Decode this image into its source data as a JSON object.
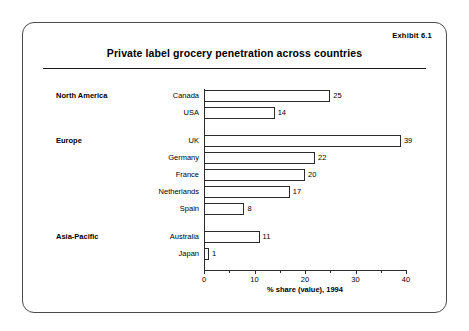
{
  "exhibit_label": "Exhibit 6.1",
  "title": "Private label grocery penetration across countries",
  "chart_data": {
    "type": "bar",
    "orientation": "horizontal",
    "title": "Private label grocery penetration across countries",
    "xlabel": "% share (value), 1994",
    "ylabel": "",
    "xlim": [
      0,
      40
    ],
    "xticks": [
      0,
      10,
      20,
      30,
      40
    ],
    "xtick_labels": [
      "0",
      "10",
      "20",
      "30",
      "40"
    ],
    "minor_tick_step": 5,
    "grid": false,
    "legend": false,
    "categories": [
      "Canada",
      "USA",
      "UK",
      "Germany",
      "France",
      "Netherlands",
      "Spain",
      "Australia",
      "Japan"
    ],
    "values": [
      25,
      14,
      39,
      22,
      20,
      17,
      8,
      11,
      1
    ],
    "groups": [
      {
        "region": "North America",
        "items": [
          {
            "country": "Canada",
            "value": 25,
            "value_label": "25"
          },
          {
            "country": "USA",
            "value": 14,
            "value_label": "14"
          }
        ]
      },
      {
        "region": "Europe",
        "items": [
          {
            "country": "UK",
            "value": 39,
            "value_label": "39"
          },
          {
            "country": "Germany",
            "value": 22,
            "value_label": "22"
          },
          {
            "country": "France",
            "value": 20,
            "value_label": "20"
          },
          {
            "country": "Netherlands",
            "value": 17,
            "value_label": "17"
          },
          {
            "country": "Spain",
            "value": 8,
            "value_label": "8"
          }
        ]
      },
      {
        "region": "Asia-Pacific",
        "items": [
          {
            "country": "Australia",
            "value": 11,
            "value_label": "11"
          },
          {
            "country": "Japan",
            "value": 1,
            "value_label": "1"
          }
        ]
      }
    ],
    "colors": {
      "bar_fill": "#ffffff",
      "bar_stroke": "#2b2b2b",
      "axis": "#2b2b2b",
      "text": "#000000",
      "frame": "#4a4a4a"
    }
  }
}
